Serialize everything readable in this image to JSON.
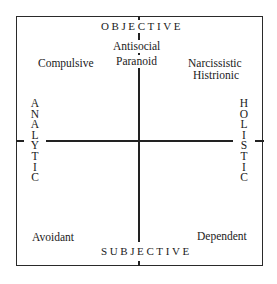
{
  "diagram": {
    "type": "quadrant",
    "axes": {
      "top": "OBJECTIVE",
      "bottom": "SUBJECTIVE",
      "left": "ANALYTIC",
      "right": "HOLISTIC"
    },
    "quadrants": {
      "top_center": [
        "Antisocial",
        "Paranoid"
      ],
      "top_left": [
        "Compulsive"
      ],
      "top_right": [
        "Narcissistic",
        "Histrionic"
      ],
      "bottom_left": [
        "Avoidant"
      ],
      "bottom_right": [
        "Dependent"
      ]
    },
    "colors": {
      "line": "#222222",
      "text": "#1a1a1a",
      "background": "#ffffff"
    }
  },
  "left_letters": [
    "A",
    "N",
    "A",
    "L",
    "Y",
    "T",
    "I",
    "C"
  ],
  "right_letters": [
    "H",
    "O",
    "L",
    "I",
    "S",
    "T",
    "I",
    "C"
  ]
}
